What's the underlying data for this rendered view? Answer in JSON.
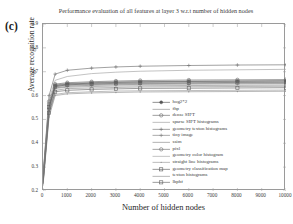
{
  "panel_label": "(c)",
  "chart_data": {
    "type": "line",
    "title": "Performance evaluation of all features at layer 3 w.r.t number of hidden nodes",
    "xlabel": "Number of hidden nodes",
    "ylabel": "Average recognition rate",
    "xlim": [
      0,
      10000
    ],
    "ylim": [
      0.2,
      0.9
    ],
    "xticks": [
      0,
      1000,
      2000,
      3000,
      4000,
      5000,
      6000,
      7000,
      8000,
      9000,
      10000
    ],
    "xtick_labels": [
      "0",
      "1000",
      "2000",
      "3000",
      "4000",
      "5000",
      "6000",
      "7000",
      "8000",
      "9000",
      "10000"
    ],
    "yticks": [
      0.2,
      0.3,
      0.4,
      0.5,
      0.6,
      0.7,
      0.8,
      0.9
    ],
    "ytick_labels": [
      "0.2",
      "0.3",
      "0.4",
      "0.5",
      "0.6",
      "0.7",
      "0.8",
      "0.9"
    ],
    "grid": false,
    "legend_position": "center-right",
    "x": [
      0,
      250,
      500,
      1000,
      2000,
      3000,
      4000,
      6000,
      8000,
      10000
    ],
    "series": [
      {
        "name": "hog2*2",
        "marker": "circle-filled",
        "color": "#555555",
        "values": [
          0.235,
          0.545,
          0.641,
          0.648,
          0.652,
          0.655,
          0.657,
          0.659,
          0.66,
          0.661
        ]
      },
      {
        "name": "fhp",
        "marker": "none",
        "color": "#8a8a8a",
        "values": [
          0.24,
          0.56,
          0.63,
          0.635,
          0.638,
          0.64,
          0.641,
          0.642,
          0.643,
          0.644
        ]
      },
      {
        "name": "dense SIFT",
        "marker": "circle-open",
        "color": "#6a6a6a",
        "values": [
          0.258,
          0.575,
          0.648,
          0.654,
          0.658,
          0.661,
          0.663,
          0.665,
          0.666,
          0.667
        ]
      },
      {
        "name": "sparse SIFT histograms",
        "marker": "none",
        "color": "#9c9c9c",
        "values": [
          0.228,
          0.52,
          0.605,
          0.612,
          0.616,
          0.619,
          0.62,
          0.621,
          0.622,
          0.623
        ]
      },
      {
        "name": "geometry texton histograms",
        "marker": "plus",
        "color": "#707070",
        "values": [
          0.262,
          0.6,
          0.69,
          0.706,
          0.715,
          0.72,
          0.723,
          0.726,
          0.728,
          0.729
        ]
      },
      {
        "name": "tiny image",
        "marker": "plus",
        "color": "#7d7d7d",
        "values": [
          0.232,
          0.545,
          0.632,
          0.639,
          0.643,
          0.645,
          0.647,
          0.648,
          0.649,
          0.65
        ]
      },
      {
        "name": "ssim",
        "marker": "none",
        "color": "#888888",
        "values": [
          0.245,
          0.558,
          0.637,
          0.643,
          0.646,
          0.648,
          0.65,
          0.651,
          0.652,
          0.653
        ]
      },
      {
        "name": "pixl",
        "marker": "circle-open",
        "color": "#6f6f6f",
        "values": [
          0.25,
          0.565,
          0.644,
          0.65,
          0.654,
          0.657,
          0.658,
          0.66,
          0.661,
          0.662
        ]
      },
      {
        "name": "geometry color histogram",
        "marker": "none",
        "color": "#a2a2a2",
        "values": [
          0.255,
          0.585,
          0.664,
          0.68,
          0.692,
          0.698,
          0.702,
          0.706,
          0.708,
          0.71
        ]
      },
      {
        "name": "straight line histograms",
        "marker": "dot",
        "color": "#959595",
        "values": [
          0.222,
          0.51,
          0.6,
          0.607,
          0.611,
          0.613,
          0.615,
          0.616,
          0.617,
          0.618
        ]
      },
      {
        "name": "geometry classification map",
        "marker": "square",
        "color": "#5e5e5e",
        "values": [
          0.248,
          0.552,
          0.638,
          0.645,
          0.649,
          0.651,
          0.653,
          0.654,
          0.655,
          0.656
        ]
      },
      {
        "name": "texton histograms",
        "marker": "none",
        "color": "#909090",
        "values": [
          0.238,
          0.535,
          0.622,
          0.629,
          0.632,
          0.634,
          0.636,
          0.637,
          0.638,
          0.639
        ]
      },
      {
        "name": "lbphf",
        "marker": "square",
        "color": "#666666",
        "values": [
          0.23,
          0.528,
          0.616,
          0.622,
          0.626,
          0.628,
          0.63,
          0.631,
          0.632,
          0.633
        ]
      }
    ]
  }
}
